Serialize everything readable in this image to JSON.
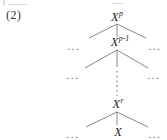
{
  "figure": {
    "equation_number": "(2)",
    "type": "tree-diagram",
    "background_color": "#ffffff",
    "ink_color": "#2b2b2b",
    "edge_color": "#555555"
  },
  "nodes": {
    "root": {
      "base": "X",
      "sup": "p",
      "label": "X^p"
    },
    "second": {
      "base": "X",
      "sup": "p-1",
      "label": "X^(p-1)"
    },
    "r_level": {
      "base": "X",
      "sup": "r",
      "label": "X^r"
    },
    "leaf": {
      "base": "X",
      "sup": "",
      "label": "X"
    }
  },
  "ellipses": {
    "row2_left": "...",
    "row2_right": "...",
    "row3_left": "...",
    "row3_right": "...",
    "row5_left": "...",
    "row5_right": "..."
  },
  "vertical_dots": {
    "glyph": "vertical-dotted-line",
    "meaning": "continuation between X^(p-1) and X^r"
  }
}
